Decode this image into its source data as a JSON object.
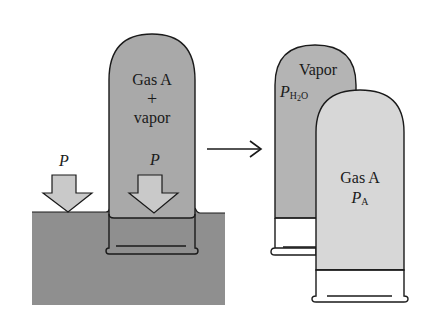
{
  "colors": {
    "water": "#8f8f8f",
    "mixed_tube_fill": "#a9a9a9",
    "vapor_tube_fill": "#b4b4b4",
    "gasA_tube_fill": "#d7d7d7",
    "arrow_fill": "#c9c9c9",
    "outline": "#1a1a1a",
    "background": "#ffffff"
  },
  "left": {
    "tube_label_line1": "Gas A",
    "tube_label_line2": "+",
    "tube_label_line3": "vapor",
    "outside_pressure": "P",
    "inside_pressure": "P"
  },
  "transition_arrow": "→",
  "right": {
    "vapor_tube": {
      "label": "Vapor",
      "pressure_symbol": "P",
      "pressure_subscript": "H2O",
      "sub_main": "H",
      "sub_num": "2",
      "sub_tail": "O"
    },
    "gas_tube": {
      "label": "Gas A",
      "pressure_symbol": "P",
      "pressure_subscript": "A"
    }
  }
}
